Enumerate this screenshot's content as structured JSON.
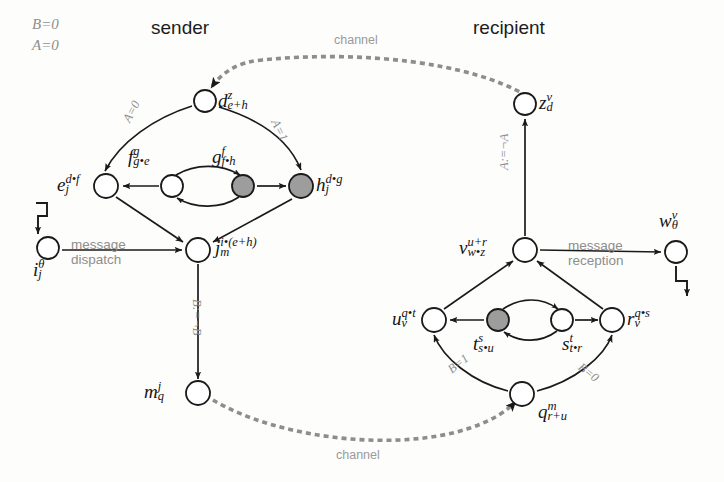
{
  "diagram": {
    "title_left": "sender",
    "title_right": "recipient",
    "state_flags": {
      "line1": "B=0",
      "line2": "A=0"
    },
    "channel_top_label": "channel",
    "channel_bottom_label": "channel",
    "message_dispatch": {
      "line1": "message",
      "line2": "dispatch"
    },
    "message_reception": {
      "line1": "message",
      "line2": "reception"
    }
  },
  "nodes": {
    "d": {
      "id": "d",
      "base": "d",
      "sup": "z",
      "sub": "e+h",
      "fill": "white",
      "x": 205,
      "y": 101
    },
    "e": {
      "id": "e",
      "base": "e",
      "sup": "d•f",
      "sub": "j",
      "fill": "white",
      "x": 106,
      "y": 186
    },
    "f": {
      "id": "f",
      "base": "f",
      "sup": "g",
      "sub": "g•e",
      "fill": "white",
      "x": 172,
      "y": 186
    },
    "g": {
      "id": "g",
      "base": "g",
      "sup": "f",
      "sub": "f•h",
      "fill": "gray",
      "x": 243,
      "y": 186
    },
    "h": {
      "id": "h",
      "base": "h",
      "sup": "d•g",
      "sub": "j",
      "fill": "gray",
      "x": 301,
      "y": 186
    },
    "i": {
      "id": "i",
      "base": "i",
      "sup": "θ",
      "sub": "j",
      "fill": "white",
      "x": 48,
      "y": 248
    },
    "j": {
      "id": "j",
      "base": "j",
      "sup": "i•(e+h)",
      "sub": "m",
      "fill": "white",
      "x": 198,
      "y": 250
    },
    "m": {
      "id": "m",
      "base": "m",
      "sup": "j",
      "sub": "q",
      "fill": "white",
      "x": 198,
      "y": 393
    },
    "z": {
      "id": "z",
      "base": "z",
      "sup": "v",
      "sub": "d",
      "fill": "white",
      "x": 525,
      "y": 104
    },
    "v": {
      "id": "v",
      "base": "v",
      "sup": "u+r",
      "sub": "w•z",
      "fill": "white",
      "x": 525,
      "y": 250
    },
    "w": {
      "id": "w",
      "base": "w",
      "sup": "v",
      "sub": "θ",
      "fill": "white",
      "x": 676,
      "y": 252
    },
    "u": {
      "id": "u",
      "base": "u",
      "sup": "q•t",
      "sub": "v",
      "fill": "white",
      "x": 434,
      "y": 320
    },
    "t": {
      "id": "t",
      "base": "t",
      "sup": "s",
      "sub": "s•u",
      "fill": "gray",
      "x": 498,
      "y": 320
    },
    "s": {
      "id": "s",
      "base": "s",
      "sup": "t",
      "sub": "t•r",
      "fill": "white",
      "x": 562,
      "y": 320
    },
    "r": {
      "id": "r",
      "base": "r",
      "sup": "q•s",
      "sub": "v",
      "fill": "white",
      "x": 612,
      "y": 320
    },
    "q": {
      "id": "q",
      "base": "q",
      "sup": "m",
      "sub": "r+u",
      "fill": "white",
      "x": 522,
      "y": 394
    }
  },
  "edge_labels": {
    "d_to_e": "A=0",
    "d_to_h": "A=1",
    "j_to_m": "B:=¬B",
    "v_to_z": "A:=¬A",
    "q_to_u": "B=1",
    "q_to_r": "B=0"
  },
  "colors": {
    "stroke": "#1a1a1a",
    "node_fill_white": "#ffffff",
    "node_fill_gray": "#9d9d9d",
    "label_gray": "#8e8e8e",
    "channel_gray": "#a6a6a6",
    "background": "#fdfdfc"
  }
}
